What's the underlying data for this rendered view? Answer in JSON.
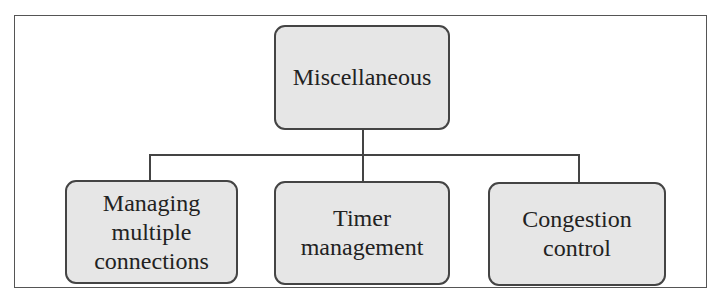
{
  "diagram": {
    "root": {
      "label": "Miscellaneous"
    },
    "children": [
      {
        "label": "Managing multiple connections"
      },
      {
        "label": "Timer management"
      },
      {
        "label": "Congestion control"
      }
    ]
  }
}
